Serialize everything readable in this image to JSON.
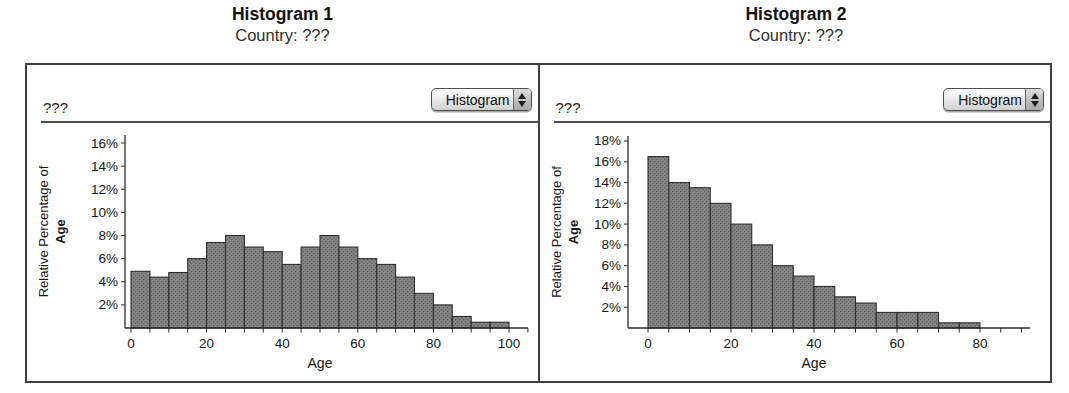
{
  "colors": {
    "bar_fill": "#848484",
    "bar_dot": "#5e5e5e",
    "bar_stroke": "#2f2f2f",
    "axis": "#2b2b2b",
    "border": "#3f3f3f",
    "text": "#1b1b1b"
  },
  "panels": [
    {
      "title": "Histogram 1",
      "subtitle": "Country: ???",
      "attribute_placeholder": "???",
      "dropdown_label": "Histogram"
    },
    {
      "title": "Histogram 2",
      "subtitle": "Country: ???",
      "attribute_placeholder": "???",
      "dropdown_label": "Histogram"
    }
  ],
  "chart_data": [
    {
      "type": "bar",
      "title": "Histogram 1",
      "subtitle": "Country: ???",
      "xlabel": "Age",
      "ylabel_line1": "Relative Percentage of",
      "ylabel_line2": "Age",
      "ytick_suffix": "%",
      "bin_width": 5,
      "bin_edges": [
        0,
        5,
        10,
        15,
        20,
        25,
        30,
        35,
        40,
        45,
        50,
        55,
        60,
        65,
        70,
        75,
        80,
        85,
        90,
        95,
        100
      ],
      "values": [
        4.9,
        4.4,
        4.8,
        6.0,
        7.4,
        8.0,
        7.0,
        6.6,
        5.5,
        7.0,
        8.0,
        7.0,
        6.0,
        5.5,
        4.4,
        3.0,
        2.0,
        1.0,
        0.5,
        0.5
      ],
      "xlim": [
        0,
        105
      ],
      "ylim": [
        0,
        16.7
      ],
      "ytick_step": 2,
      "xtick_minor_step": 5,
      "xtick_label_step": 20,
      "grid": false,
      "legend": "none"
    },
    {
      "type": "bar",
      "title": "Histogram 2",
      "subtitle": "Country: ???",
      "xlabel": "Age",
      "ylabel_line1": "Relative Percentage of",
      "ylabel_line2": "Age",
      "ytick_suffix": "%",
      "bin_width": 5,
      "bin_edges": [
        0,
        5,
        10,
        15,
        20,
        25,
        30,
        35,
        40,
        45,
        50,
        55,
        60,
        65,
        70,
        75,
        80
      ],
      "values": [
        16.5,
        14.0,
        13.5,
        12.0,
        10.0,
        8.0,
        6.0,
        5.0,
        4.0,
        3.0,
        2.4,
        1.5,
        1.5,
        1.5,
        0.5,
        0.5
      ],
      "xlim": [
        0,
        92
      ],
      "ylim": [
        0,
        18.5
      ],
      "ytick_step": 2,
      "xtick_minor_step": 5,
      "xtick_label_step": 20,
      "grid": false,
      "legend": "none"
    }
  ]
}
